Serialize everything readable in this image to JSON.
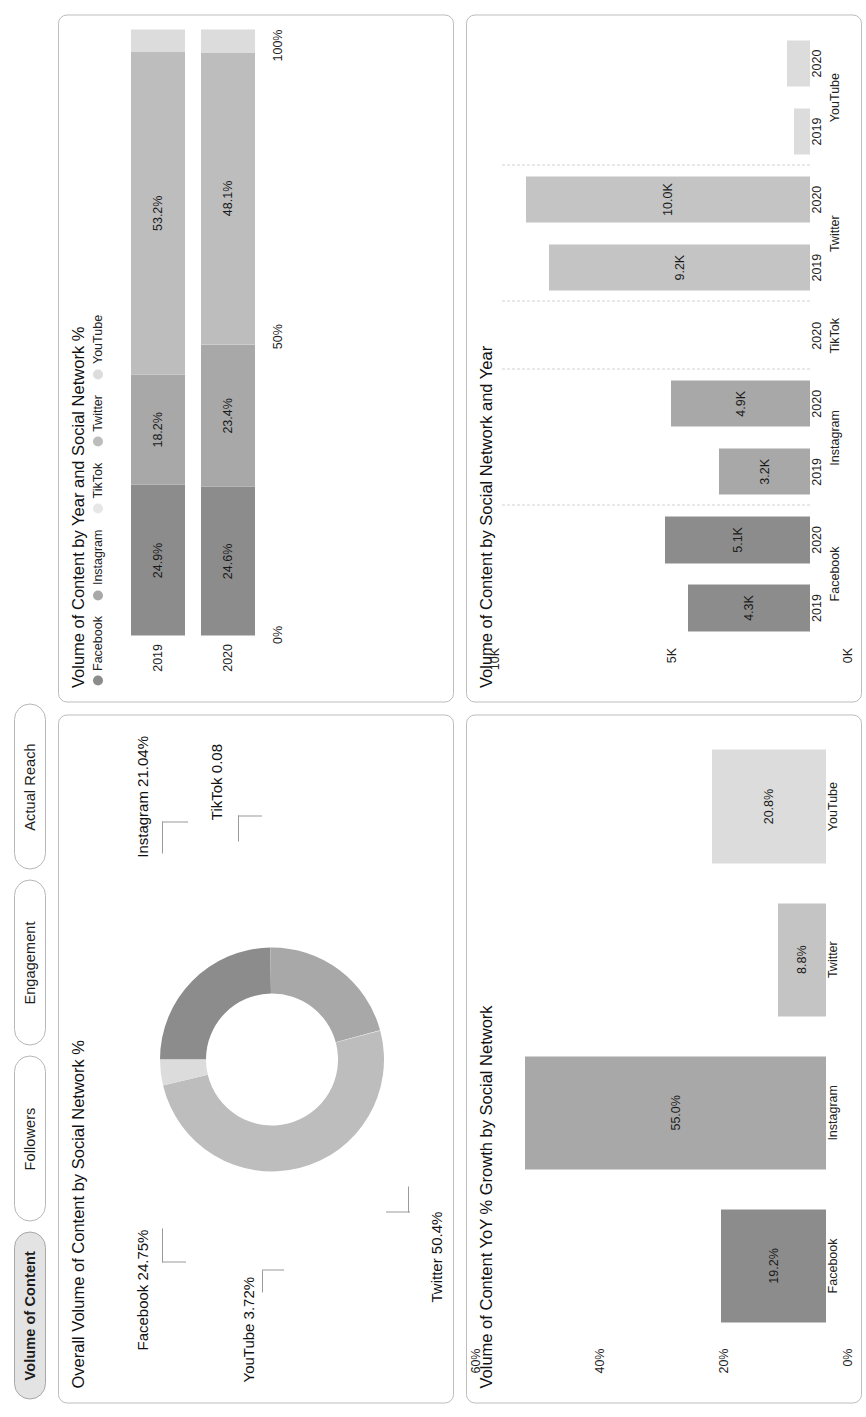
{
  "tabs": [
    {
      "label": "Volume of Content",
      "active": true
    },
    {
      "label": "Followers",
      "active": false
    },
    {
      "label": "Engagement",
      "active": false
    },
    {
      "label": "Actual Reach",
      "active": false
    }
  ],
  "colors": {
    "facebook": "#8c8c8c",
    "instagram": "#a8a8a8",
    "tiktok": "#e6e6e6",
    "twitter": "#bdbdbd",
    "youtube": "#dcdcdc",
    "panel_border": "#bdbdbd",
    "tab_active_bg": "#e3e3e3",
    "text": "#111111"
  },
  "panels": {
    "donut": {
      "title": "Overall Volume of Content by Social Network %"
    },
    "stacked": {
      "title": "Volume of Content by Year and Social Network %"
    },
    "yoy": {
      "title": "Volume of Content YoY % Growth by Social Network"
    },
    "grouped": {
      "title": "Volume of Content by Social Network and Year"
    }
  },
  "chart_data": [
    {
      "type": "pie",
      "id": "overall-volume-donut",
      "title": "Overall Volume of Content by Social Network %",
      "donut": true,
      "labels": [
        "Facebook",
        "Instagram",
        "TikTok",
        "Twitter",
        "YouTube"
      ],
      "values": [
        24.75,
        21.04,
        0.08,
        50.4,
        3.72
      ],
      "annotations": [
        "Facebook 24.75%",
        "Instagram 21.04%",
        "TikTok 0.08",
        "Twitter 50.4%",
        "YouTube 3.72%"
      ],
      "legend": "labels-outside"
    },
    {
      "type": "bar",
      "id": "volume-by-year-and-network-stacked",
      "orientation": "horizontal",
      "stacked": true,
      "title": "Volume of Content by Year and Social Network %",
      "categories": [
        "2019",
        "2020"
      ],
      "legend": [
        "Facebook",
        "Instagram",
        "TikTok",
        "Twitter",
        "YouTube"
      ],
      "legend_position": "top",
      "series": [
        {
          "name": "Facebook",
          "values": [
            24.9,
            24.6
          ],
          "labels": [
            "24.9%",
            "24.6%"
          ]
        },
        {
          "name": "Instagram",
          "values": [
            18.2,
            23.4
          ],
          "labels": [
            "18.2%",
            "23.4%"
          ]
        },
        {
          "name": "TikTok",
          "values": [
            0.0,
            0.1
          ],
          "labels": [
            "",
            ""
          ]
        },
        {
          "name": "Twitter",
          "values": [
            53.2,
            48.1
          ],
          "labels": [
            "53.2%",
            "48.1%"
          ]
        },
        {
          "name": "YouTube",
          "values": [
            3.7,
            3.8
          ],
          "labels": [
            "",
            ""
          ]
        }
      ],
      "xlabel": "",
      "ylabel": "",
      "xticks": [
        "0%",
        "50%",
        "100%"
      ],
      "xlim": [
        0,
        100
      ],
      "grid": false
    },
    {
      "type": "bar",
      "id": "volume-yoy-growth",
      "orientation": "vertical",
      "title": "Volume of Content YoY % Growth by Social Network",
      "categories": [
        "Facebook",
        "Instagram",
        "Twitter",
        "YouTube"
      ],
      "values": [
        19.2,
        55.0,
        8.8,
        20.8
      ],
      "value_labels": [
        "19.2%",
        "55.0%",
        "8.8%",
        "20.8%"
      ],
      "bar_colors": [
        "#8c8c8c",
        "#a8a8a8",
        "#c4c4c4",
        "#dcdcdc"
      ],
      "yticks": [
        "0%",
        "20%",
        "40%",
        "60%"
      ],
      "ylim": [
        0,
        60
      ],
      "xlabel": "",
      "ylabel": "",
      "grid": false
    },
    {
      "type": "bar",
      "id": "volume-by-network-and-year-grouped",
      "orientation": "vertical",
      "grouped": true,
      "title": "Volume of Content by Social Network and Year",
      "groups": [
        "Facebook",
        "Instagram",
        "TikTok",
        "Twitter",
        "YouTube"
      ],
      "subcategories": [
        "2019",
        "2020"
      ],
      "bars": [
        {
          "group": "Facebook",
          "year": "2019",
          "value": 4.3,
          "label": "4.3K",
          "color": "#8c8c8c"
        },
        {
          "group": "Facebook",
          "year": "2020",
          "value": 5.1,
          "label": "5.1K",
          "color": "#8c8c8c"
        },
        {
          "group": "Instagram",
          "year": "2019",
          "value": 3.2,
          "label": "3.2K",
          "color": "#a8a8a8"
        },
        {
          "group": "Instagram",
          "year": "2020",
          "value": 4.9,
          "label": "4.9K",
          "color": "#a8a8a8"
        },
        {
          "group": "TikTok",
          "year": "2020",
          "value": 0.0,
          "label": "",
          "color": "#e6e6e6"
        },
        {
          "group": "Twitter",
          "year": "2019",
          "value": 9.2,
          "label": "9.2K",
          "color": "#c4c4c4"
        },
        {
          "group": "Twitter",
          "year": "2020",
          "value": 10.0,
          "label": "10.0K",
          "color": "#c4c4c4"
        },
        {
          "group": "YouTube",
          "year": "2019",
          "value": 0.55,
          "label": "",
          "color": "#dcdcdc"
        },
        {
          "group": "YouTube",
          "year": "2020",
          "value": 0.8,
          "label": "",
          "color": "#dcdcdc"
        }
      ],
      "yticks": [
        "0K",
        "5K",
        "10K"
      ],
      "ylim": [
        0,
        11
      ],
      "xlabel": "",
      "ylabel": "",
      "grid": false
    }
  ]
}
